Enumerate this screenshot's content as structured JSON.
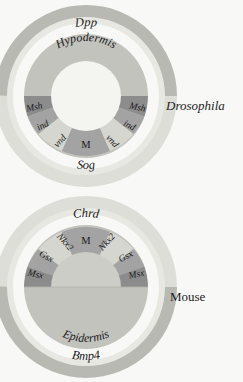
{
  "figure": {
    "type": "comparative-cross-section-diagram",
    "background_color": "#f8f8f6"
  },
  "palette": {
    "dark_gray": "#8c8c8c",
    "mid_gray": "#a8a8a8",
    "light_gray": "#c9c9c4",
    "pale_gray": "#d8d8d2",
    "very_pale": "#e2e2dc",
    "white_gap": "#f6f6f3",
    "text": "#1a1a1a"
  },
  "panels": [
    {
      "id": "drosophila",
      "species_label": "Drosophila",
      "species_italic": true,
      "dorsal_signal": "Dpp",
      "ventral_signal": "Sog",
      "tissue_label": "Hypodermis",
      "midline_label": "M",
      "orientation": "dorsal-top",
      "segments": [
        {
          "label": "Msh",
          "side": "left",
          "shade": "dark_gray"
        },
        {
          "label": "ind",
          "side": "left",
          "shade": "mid_gray"
        },
        {
          "label": "vnd",
          "side": "left",
          "shade": "pale_gray"
        },
        {
          "label": "M",
          "side": "center",
          "shade": "mid_gray"
        },
        {
          "label": "vnd",
          "side": "right",
          "shade": "pale_gray"
        },
        {
          "label": "ind",
          "side": "right",
          "shade": "mid_gray"
        },
        {
          "label": "Msh",
          "side": "right",
          "shade": "dark_gray"
        }
      ]
    },
    {
      "id": "mouse",
      "species_label": "Mouse",
      "species_italic": false,
      "dorsal_signal": "Chrd",
      "ventral_signal": "Bmp4",
      "tissue_label": "Epidermis",
      "midline_label": "M",
      "orientation": "dorsal-bottom",
      "segments": [
        {
          "label": "Msx",
          "side": "left",
          "shade": "dark_gray"
        },
        {
          "label": "Gsx",
          "side": "left",
          "shade": "mid_gray"
        },
        {
          "label": "Nkx2",
          "side": "left",
          "shade": "pale_gray"
        },
        {
          "label": "M",
          "side": "center",
          "shade": "mid_gray"
        },
        {
          "label": "Nkx2",
          "side": "right",
          "shade": "pale_gray"
        },
        {
          "label": "Gsx",
          "side": "right",
          "shade": "mid_gray"
        },
        {
          "label": "Msx",
          "side": "right",
          "shade": "dark_gray"
        }
      ]
    }
  ]
}
